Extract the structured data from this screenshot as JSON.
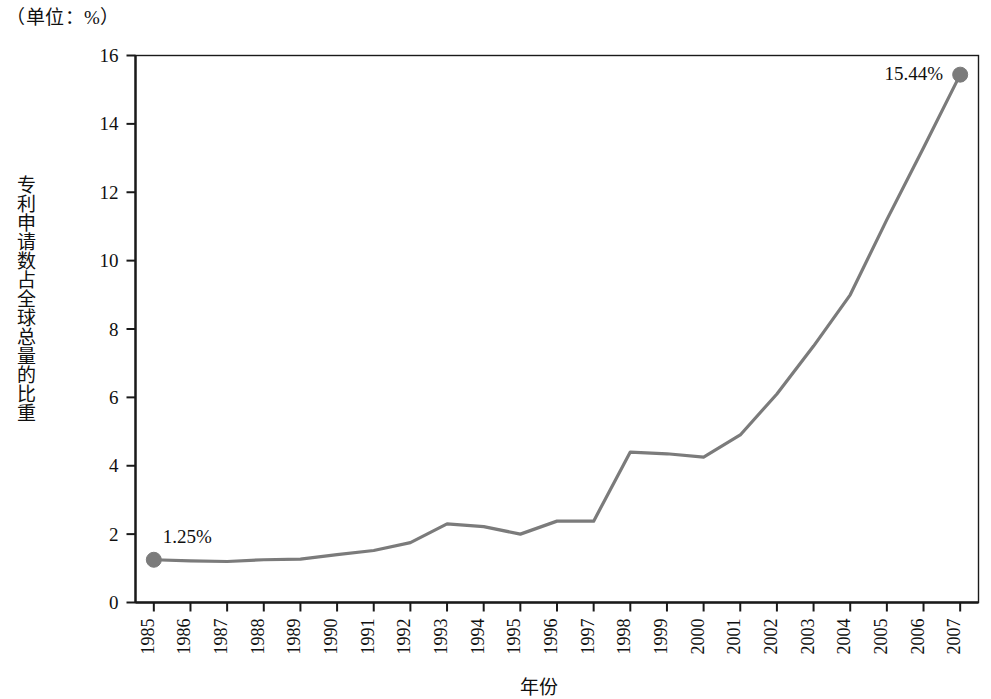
{
  "unit_caption": "（单位：%）",
  "axis_titles": {
    "y": "专利申请数占全球总量的比重",
    "x": "年份"
  },
  "chart_data": {
    "type": "line",
    "title": "",
    "subtitle": "",
    "unit_note": "（单位：%）",
    "xlabel": "年份",
    "ylabel": "专利申请数占全球总量的比重",
    "xlim": [
      1985,
      2007
    ],
    "ylim": [
      0,
      16
    ],
    "ytick_step": 2,
    "yticks": [
      0,
      2,
      4,
      6,
      8,
      10,
      12,
      14,
      16
    ],
    "ytick_labels": [
      "0",
      "2",
      "4",
      "6",
      "8",
      "10",
      "12",
      "14",
      "16"
    ],
    "grid": false,
    "legend": null,
    "legend_position": "none",
    "categories": [
      "1985",
      "1986",
      "1987",
      "1988",
      "1989",
      "1990",
      "1991",
      "1992",
      "1993",
      "1994",
      "1995",
      "1996",
      "1997",
      "1998",
      "1999",
      "2000",
      "2001",
      "2002",
      "2003",
      "2004",
      "2005",
      "2006",
      "2007"
    ],
    "x": [
      1985,
      1986,
      1987,
      1988,
      1989,
      1990,
      1991,
      1992,
      1993,
      1994,
      1995,
      1996,
      1997,
      1998,
      1999,
      2000,
      2001,
      2002,
      2003,
      2004,
      2005,
      2006,
      2007
    ],
    "values": [
      1.25,
      1.22,
      1.2,
      1.25,
      1.27,
      1.4,
      1.52,
      1.75,
      2.3,
      2.22,
      2.0,
      2.38,
      2.38,
      4.4,
      4.35,
      4.25,
      4.9,
      6.1,
      7.5,
      9.0,
      11.2,
      13.3,
      15.44
    ],
    "series": [
      {
        "name": "专利申请数占全球总量的比重",
        "color": "#7b7b7b",
        "values": [
          1.25,
          1.22,
          1.2,
          1.25,
          1.27,
          1.4,
          1.52,
          1.75,
          2.3,
          2.22,
          2.0,
          2.38,
          2.38,
          4.4,
          4.35,
          4.25,
          4.9,
          6.1,
          7.5,
          9.0,
          11.2,
          13.3,
          15.44
        ]
      }
    ],
    "annotations": [
      {
        "text": "1.25%",
        "x": 1985,
        "y": 1.25,
        "marker": true
      },
      {
        "text": "15.44%",
        "x": 2007,
        "y": 15.44,
        "marker": true
      }
    ],
    "marker_points": [
      {
        "x": 1985,
        "y": 1.25
      },
      {
        "x": 2007,
        "y": 15.44
      }
    ]
  },
  "style": {
    "line_color": "#7b7b7b",
    "marker_color": "#7b7b7b",
    "axis_color": "#1a1a1a",
    "text_color": "#101010",
    "background": "#ffffff"
  },
  "labels": {
    "first_point": "1.25%",
    "last_point": "15.44%"
  }
}
